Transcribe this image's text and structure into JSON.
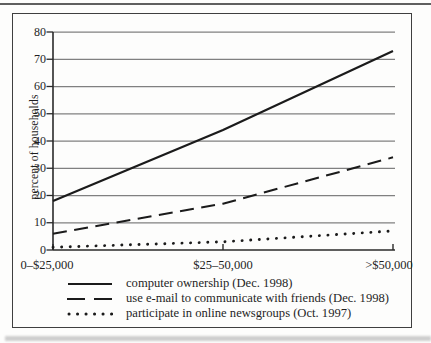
{
  "chart_data": {
    "type": "line",
    "title": "",
    "xlabel": "",
    "ylabel": "percent of households",
    "categories": [
      "0–$25,000",
      "$25–50,000",
      ">$50,000"
    ],
    "ylim": [
      0,
      80
    ],
    "yticks": [
      0,
      10,
      20,
      30,
      40,
      50,
      60,
      70,
      80
    ],
    "grid": "horizontal gridlines at every y tick",
    "legend_position": "bottom-left inside frame",
    "series": [
      {
        "name": "computer-ownership",
        "label": "computer ownership (Dec. 1998)",
        "style": "solid",
        "values": [
          18,
          44,
          73
        ]
      },
      {
        "name": "email-with-friends",
        "label": "use e-mail to communicate with friends (Dec. 1998)",
        "style": "dashed",
        "values": [
          6,
          17,
          34
        ]
      },
      {
        "name": "online-newsgroups",
        "label": "participate in online newsgroups (Oct. 1997)",
        "style": "dotted",
        "values": [
          1,
          3,
          7
        ]
      }
    ],
    "colors": {
      "line": "#1b1b1b",
      "grid": "#808080",
      "axis": "#2a2a2a",
      "frame_border": "#3f3f3f"
    }
  }
}
